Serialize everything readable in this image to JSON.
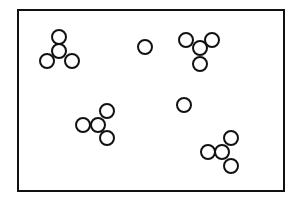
{
  "diagram": {
    "stroke_color": "#111111",
    "background_color": "#ffffff",
    "frame": {
      "x": 18,
      "y": 10,
      "width": 266,
      "height": 181,
      "stroke_width": 2
    },
    "circle_radius": 7,
    "circle_stroke_width": 2,
    "clusters": [
      {
        "name": "cluster-top-left",
        "circles": [
          {
            "cx": 59,
            "cy": 37
          },
          {
            "cx": 59,
            "cy": 51
          },
          {
            "cx": 47,
            "cy": 61
          },
          {
            "cx": 72,
            "cy": 61
          }
        ]
      },
      {
        "name": "cluster-top-right",
        "circles": [
          {
            "cx": 186,
            "cy": 40
          },
          {
            "cx": 212,
            "cy": 40
          },
          {
            "cx": 200,
            "cy": 48
          },
          {
            "cx": 200,
            "cy": 64
          }
        ]
      },
      {
        "name": "cluster-middle-left",
        "circles": [
          {
            "cx": 83,
            "cy": 125
          },
          {
            "cx": 98,
            "cy": 125
          },
          {
            "cx": 107,
            "cy": 111
          },
          {
            "cx": 107,
            "cy": 138
          }
        ]
      },
      {
        "name": "cluster-bottom-right",
        "circles": [
          {
            "cx": 208,
            "cy": 152
          },
          {
            "cx": 222,
            "cy": 152
          },
          {
            "cx": 231,
            "cy": 138
          },
          {
            "cx": 231,
            "cy": 166
          }
        ]
      }
    ],
    "singles": [
      {
        "name": "single-circle-top",
        "cx": 145,
        "cy": 47
      },
      {
        "name": "single-circle-middle",
        "cx": 184,
        "cy": 105
      }
    ]
  }
}
